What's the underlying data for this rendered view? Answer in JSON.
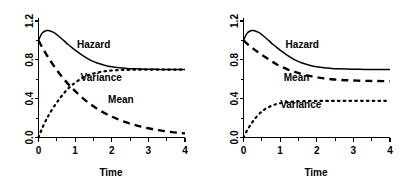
{
  "figure": {
    "panel_count": 2,
    "background_color": "#ffffff",
    "line_color": "#000000"
  },
  "axes": {
    "xlabel": "Time",
    "ylabel": "",
    "x_ticks": [
      "0",
      "1",
      "2",
      "3",
      "4"
    ],
    "y_ticks": [
      "0.0",
      "0.4",
      "0.8",
      "1.2"
    ],
    "xlim": [
      0,
      4
    ],
    "ylim": [
      0,
      1.2
    ],
    "x_minor_ticks": [
      0.5,
      1.5,
      2.5,
      3.5
    ],
    "y_minor_ticks": [
      0.2,
      0.6,
      1.0
    ],
    "grid": false
  },
  "series_labels": {
    "hazard": "Hazard",
    "variance": "Variance",
    "mean": "Mean"
  },
  "chart_data": [
    {
      "type": "line",
      "panel": "left",
      "title": "",
      "xlabel": "Time",
      "ylabel": "",
      "xlim": [
        0,
        4
      ],
      "ylim": [
        0,
        1.2
      ],
      "grid": false,
      "legend_position": "inline-annotations",
      "x": [
        0,
        0.1,
        0.2,
        0.25,
        0.3,
        0.4,
        0.5,
        0.6,
        0.7,
        0.8,
        0.9,
        1.0,
        1.2,
        1.4,
        1.6,
        1.8,
        2.0,
        2.2,
        2.4,
        2.6,
        2.8,
        3.0,
        3.2,
        3.4,
        3.6,
        3.8,
        4.0
      ],
      "series": [
        {
          "name": "Hazard",
          "style": "solid",
          "label_x": 1.05,
          "label_y": 0.92,
          "values": [
            1.0,
            1.075,
            1.1,
            1.102,
            1.1,
            1.085,
            1.06,
            1.028,
            0.995,
            0.96,
            0.93,
            0.9,
            0.845,
            0.8,
            0.768,
            0.745,
            0.728,
            0.718,
            0.712,
            0.708,
            0.705,
            0.703,
            0.702,
            0.701,
            0.7,
            0.7,
            0.7
          ]
        },
        {
          "name": "Variance",
          "style": "dotted",
          "label_x": 1.15,
          "label_y": 0.585,
          "values": [
            0.0,
            0.095,
            0.175,
            0.21,
            0.245,
            0.305,
            0.36,
            0.412,
            0.458,
            0.5,
            0.535,
            0.565,
            0.615,
            0.648,
            0.668,
            0.682,
            0.69,
            0.694,
            0.697,
            0.698,
            0.699,
            0.7,
            0.7,
            0.7,
            0.7,
            0.7,
            0.7
          ]
        },
        {
          "name": "Mean",
          "style": "dashed",
          "label_x": 1.9,
          "label_y": 0.36,
          "values": [
            1.0,
            0.93,
            0.865,
            0.835,
            0.805,
            0.748,
            0.695,
            0.645,
            0.598,
            0.555,
            0.515,
            0.478,
            0.408,
            0.348,
            0.296,
            0.252,
            0.215,
            0.183,
            0.155,
            0.132,
            0.112,
            0.095,
            0.08,
            0.068,
            0.058,
            0.049,
            0.042
          ]
        }
      ]
    },
    {
      "type": "line",
      "panel": "right",
      "title": "",
      "xlabel": "Time",
      "ylabel": "",
      "xlim": [
        0,
        4
      ],
      "ylim": [
        0,
        1.2
      ],
      "grid": false,
      "legend_position": "inline-annotations",
      "x": [
        0,
        0.1,
        0.2,
        0.25,
        0.3,
        0.4,
        0.5,
        0.6,
        0.7,
        0.8,
        0.9,
        1.0,
        1.2,
        1.4,
        1.6,
        1.8,
        2.0,
        2.2,
        2.4,
        2.6,
        2.8,
        3.0,
        3.2,
        3.4,
        3.6,
        3.8,
        4.0
      ],
      "series": [
        {
          "name": "Hazard",
          "style": "solid",
          "label_x": 1.15,
          "label_y": 0.92,
          "values": [
            1.0,
            1.075,
            1.1,
            1.102,
            1.1,
            1.085,
            1.06,
            1.028,
            0.995,
            0.96,
            0.93,
            0.9,
            0.845,
            0.8,
            0.768,
            0.745,
            0.728,
            0.718,
            0.712,
            0.708,
            0.705,
            0.703,
            0.702,
            0.701,
            0.7,
            0.7,
            0.7
          ]
        },
        {
          "name": "Mean",
          "style": "dashed",
          "label_x": 1.1,
          "label_y": 0.585,
          "values": [
            1.0,
            0.965,
            0.935,
            0.92,
            0.905,
            0.878,
            0.852,
            0.826,
            0.802,
            0.778,
            0.755,
            0.735,
            0.702,
            0.675,
            0.652,
            0.634,
            0.62,
            0.609,
            0.6,
            0.594,
            0.59,
            0.587,
            0.585,
            0.583,
            0.582,
            0.581,
            0.58
          ]
        },
        {
          "name": "Variance",
          "style": "dotted",
          "label_x": 1.0,
          "label_y": 0.3,
          "values": [
            0.0,
            0.075,
            0.135,
            0.162,
            0.188,
            0.232,
            0.268,
            0.295,
            0.315,
            0.332,
            0.344,
            0.353,
            0.364,
            0.37,
            0.373,
            0.375,
            0.376,
            0.377,
            0.377,
            0.377,
            0.378,
            0.378,
            0.378,
            0.378,
            0.378,
            0.378,
            0.378
          ]
        }
      ]
    }
  ]
}
